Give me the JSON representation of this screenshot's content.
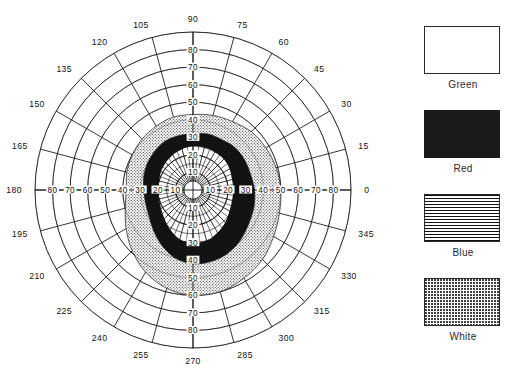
{
  "chart_data": {
    "type": "polar_scatter_isopter",
    "title": "",
    "subtitle": "",
    "xlabel": "",
    "ylabel": "",
    "center": {
      "x": 193,
      "y": 190
    },
    "outer_radius_px": 158,
    "radial_max": 90,
    "radial_tick_step": 10,
    "radial_ticks": [
      10,
      20,
      30,
      40,
      50,
      60,
      70,
      80,
      90
    ],
    "radial_tick_labels_right": [
      "10",
      "20",
      "30",
      "40",
      "50",
      "60",
      "70",
      "80",
      "0"
    ],
    "radial_tick_labels_left": [
      "10",
      "20",
      "30",
      "40",
      "50",
      "60",
      "70",
      "80",
      "180"
    ],
    "radial_tick_labels_up": [
      "10",
      "20",
      "30",
      "40",
      "50",
      "60",
      "70",
      "80",
      "90"
    ],
    "radial_tick_labels_down": [
      "10",
      "20",
      "30",
      "40",
      "50",
      "60",
      "70",
      "80",
      "270"
    ],
    "angular_tick_step": 15,
    "angular_ticks": [
      0,
      15,
      30,
      45,
      60,
      75,
      90,
      105,
      120,
      135,
      150,
      165,
      180,
      195,
      210,
      225,
      240,
      255,
      270,
      285,
      300,
      315,
      330,
      345
    ],
    "angular_tick_labels": [
      "0",
      "15",
      "30",
      "45",
      "60",
      "75",
      "90",
      "105",
      "120",
      "135",
      "150",
      "165",
      "180",
      "195",
      "210",
      "225",
      "240",
      "255",
      "270",
      "285",
      "300",
      "315",
      "330",
      "345"
    ],
    "grid": true,
    "legend_position": "right",
    "series": [
      {
        "name": "Green",
        "swatch": "empty",
        "fill": "#ffffff",
        "note": "innermost isopter region (unfilled)",
        "radii_by_angle": [
          {
            "angle": 0,
            "r_inner": 0,
            "r_outer": 23
          },
          {
            "angle": 15,
            "r_inner": 0,
            "r_outer": 23
          },
          {
            "angle": 30,
            "r_inner": 0,
            "r_outer": 24
          },
          {
            "angle": 45,
            "r_inner": 0,
            "r_outer": 25
          },
          {
            "angle": 60,
            "r_inner": 0,
            "r_outer": 25
          },
          {
            "angle": 75,
            "r_inner": 0,
            "r_outer": 25
          },
          {
            "angle": 90,
            "r_inner": 0,
            "r_outer": 25
          },
          {
            "angle": 105,
            "r_inner": 0,
            "r_outer": 24
          },
          {
            "angle": 120,
            "r_inner": 0,
            "r_outer": 23
          },
          {
            "angle": 135,
            "r_inner": 0,
            "r_outer": 22
          },
          {
            "angle": 150,
            "r_inner": 0,
            "r_outer": 21
          },
          {
            "angle": 165,
            "r_inner": 0,
            "r_outer": 20
          },
          {
            "angle": 180,
            "r_inner": 0,
            "r_outer": 20
          },
          {
            "angle": 195,
            "r_inner": 0,
            "r_outer": 20
          },
          {
            "angle": 210,
            "r_inner": 0,
            "r_outer": 21
          },
          {
            "angle": 225,
            "r_inner": 0,
            "r_outer": 23
          },
          {
            "angle": 240,
            "r_inner": 0,
            "r_outer": 26
          },
          {
            "angle": 255,
            "r_inner": 0,
            "r_outer": 29
          },
          {
            "angle": 270,
            "r_inner": 0,
            "r_outer": 30
          },
          {
            "angle": 285,
            "r_inner": 0,
            "r_outer": 30
          },
          {
            "angle": 300,
            "r_inner": 0,
            "r_outer": 28
          },
          {
            "angle": 315,
            "r_inner": 0,
            "r_outer": 26
          },
          {
            "angle": 330,
            "r_inner": 0,
            "r_outer": 24
          },
          {
            "angle": 345,
            "r_inner": 0,
            "r_outer": 23
          }
        ]
      },
      {
        "name": "Red",
        "swatch": "solid",
        "fill": "#121212",
        "note": "solid black band isopter",
        "radii_by_angle": [
          {
            "angle": 0,
            "r_inner": 23,
            "r_outer": 35
          },
          {
            "angle": 15,
            "r_inner": 23,
            "r_outer": 34
          },
          {
            "angle": 30,
            "r_inner": 24,
            "r_outer": 34
          },
          {
            "angle": 45,
            "r_inner": 25,
            "r_outer": 34
          },
          {
            "angle": 60,
            "r_inner": 25,
            "r_outer": 33
          },
          {
            "angle": 75,
            "r_inner": 25,
            "r_outer": 33
          },
          {
            "angle": 90,
            "r_inner": 25,
            "r_outer": 32
          },
          {
            "angle": 105,
            "r_inner": 24,
            "r_outer": 32
          },
          {
            "angle": 120,
            "r_inner": 23,
            "r_outer": 32
          },
          {
            "angle": 135,
            "r_inner": 22,
            "r_outer": 31
          },
          {
            "angle": 150,
            "r_inner": 21,
            "r_outer": 30
          },
          {
            "angle": 165,
            "r_inner": 20,
            "r_outer": 29
          },
          {
            "angle": 180,
            "r_inner": 20,
            "r_outer": 28
          },
          {
            "angle": 195,
            "r_inner": 20,
            "r_outer": 28
          },
          {
            "angle": 210,
            "r_inner": 21,
            "r_outer": 29
          },
          {
            "angle": 225,
            "r_inner": 23,
            "r_outer": 32
          },
          {
            "angle": 240,
            "r_inner": 26,
            "r_outer": 36
          },
          {
            "angle": 255,
            "r_inner": 29,
            "r_outer": 40
          },
          {
            "angle": 270,
            "r_inner": 30,
            "r_outer": 42
          },
          {
            "angle": 285,
            "r_inner": 30,
            "r_outer": 42
          },
          {
            "angle": 300,
            "r_inner": 28,
            "r_outer": 41
          },
          {
            "angle": 315,
            "r_inner": 26,
            "r_outer": 39
          },
          {
            "angle": 330,
            "r_inner": 24,
            "r_outer": 37
          },
          {
            "angle": 345,
            "r_inner": 23,
            "r_outer": 36
          }
        ]
      },
      {
        "name": "Blue",
        "swatch": "horizontal-lines",
        "fill": "#horizontal-hatch",
        "note": "horizontal line hatch pattern (legend only)",
        "radii_by_angle": []
      },
      {
        "name": "White",
        "swatch": "stipple",
        "fill": "#stipple",
        "note": "outermost stippled band isopter",
        "radii_by_angle": [
          {
            "angle": 0,
            "r_inner": 35,
            "r_outer": 50
          },
          {
            "angle": 15,
            "r_inner": 34,
            "r_outer": 49
          },
          {
            "angle": 30,
            "r_inner": 34,
            "r_outer": 48
          },
          {
            "angle": 45,
            "r_inner": 34,
            "r_outer": 47
          },
          {
            "angle": 60,
            "r_inner": 33,
            "r_outer": 45
          },
          {
            "angle": 75,
            "r_inner": 33,
            "r_outer": 44
          },
          {
            "angle": 90,
            "r_inner": 32,
            "r_outer": 43
          },
          {
            "angle": 105,
            "r_inner": 32,
            "r_outer": 43
          },
          {
            "angle": 120,
            "r_inner": 32,
            "r_outer": 42
          },
          {
            "angle": 135,
            "r_inner": 31,
            "r_outer": 41
          },
          {
            "angle": 150,
            "r_inner": 30,
            "r_outer": 40
          },
          {
            "angle": 165,
            "r_inner": 29,
            "r_outer": 39
          },
          {
            "angle": 180,
            "r_inner": 28,
            "r_outer": 38
          },
          {
            "angle": 195,
            "r_inner": 28,
            "r_outer": 40
          },
          {
            "angle": 210,
            "r_inner": 29,
            "r_outer": 44
          },
          {
            "angle": 225,
            "r_inner": 32,
            "r_outer": 49
          },
          {
            "angle": 240,
            "r_inner": 36,
            "r_outer": 54
          },
          {
            "angle": 255,
            "r_inner": 40,
            "r_outer": 58
          },
          {
            "angle": 270,
            "r_inner": 42,
            "r_outer": 60
          },
          {
            "angle": 285,
            "r_inner": 42,
            "r_outer": 60
          },
          {
            "angle": 300,
            "r_inner": 41,
            "r_outer": 58
          },
          {
            "angle": 315,
            "r_inner": 39,
            "r_outer": 56
          },
          {
            "angle": 330,
            "r_inner": 37,
            "r_outer": 53
          },
          {
            "angle": 345,
            "r_inner": 36,
            "r_outer": 51
          }
        ]
      }
    ]
  },
  "legend": {
    "items": [
      {
        "label": "Green",
        "swatch": "empty"
      },
      {
        "label": "Red",
        "swatch": "solid"
      },
      {
        "label": "Blue",
        "swatch": "horizontal-lines"
      },
      {
        "label": "White",
        "swatch": "stipple"
      }
    ]
  },
  "colors": {
    "ink": "#121212",
    "grid": "#1d1d1d",
    "paper": "#ffffff"
  }
}
